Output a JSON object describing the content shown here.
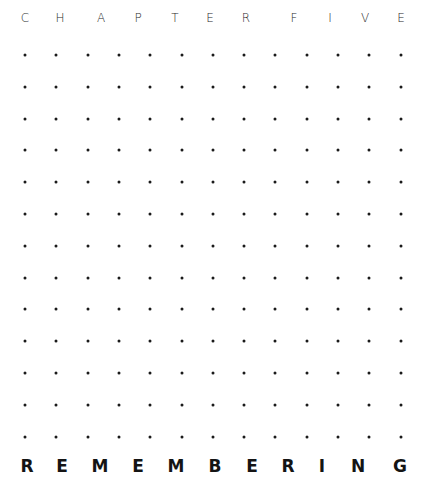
{
  "header": {
    "text": "CHAPTER FIVE",
    "letters": [
      {
        "char": "C",
        "x": 25
      },
      {
        "char": "H",
        "x": 60
      },
      {
        "char": "A",
        "x": 101
      },
      {
        "char": "P",
        "x": 138
      },
      {
        "char": "T",
        "x": 175
      },
      {
        "char": "E",
        "x": 210
      },
      {
        "char": "R",
        "x": 246
      },
      {
        "char": "F",
        "x": 294
      },
      {
        "char": "I",
        "x": 330
      },
      {
        "char": "V",
        "x": 365
      },
      {
        "char": "E",
        "x": 401
      }
    ]
  },
  "dot_grid": {
    "columns": 13,
    "rows": 13,
    "x_start": 25,
    "x_step": 31.3,
    "y_start": 55,
    "y_step": 31.8,
    "color": "#1a1a1a"
  },
  "footer": {
    "text": "REMEMBERING",
    "letters": [
      {
        "char": "R",
        "x": 27
      },
      {
        "char": "E",
        "x": 62
      },
      {
        "char": "M",
        "x": 100
      },
      {
        "char": "E",
        "x": 138
      },
      {
        "char": "M",
        "x": 176
      },
      {
        "char": "B",
        "x": 215
      },
      {
        "char": "E",
        "x": 252
      },
      {
        "char": "R",
        "x": 288
      },
      {
        "char": "I",
        "x": 322
      },
      {
        "char": "N",
        "x": 358
      },
      {
        "char": "G",
        "x": 400
      }
    ]
  }
}
